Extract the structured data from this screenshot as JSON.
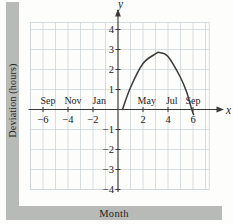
{
  "figure": {
    "y_caption": "Deviation (hours)",
    "x_caption": "Month"
  },
  "chart_data": {
    "type": "line",
    "title": "",
    "xlabel": "Month",
    "ylabel": "Deviation (hours)",
    "x_axis_letter": "x",
    "y_axis_letter": "y",
    "xlim": [
      -7,
      7.3
    ],
    "ylim": [
      -4,
      4.35
    ],
    "grid": true,
    "legend": "none",
    "x_ticks": [
      {
        "value": -6,
        "label": "−6"
      },
      {
        "value": -4,
        "label": "−4"
      },
      {
        "value": -2,
        "label": "−2"
      },
      {
        "value": 2,
        "label": "2"
      },
      {
        "value": 4,
        "label": "4"
      },
      {
        "value": 6,
        "label": "6"
      }
    ],
    "y_ticks": [
      {
        "value": 4,
        "label": "4"
      },
      {
        "value": 3,
        "label": "3"
      },
      {
        "value": 2,
        "label": "2"
      },
      {
        "value": 1,
        "label": "1"
      },
      {
        "value": -1,
        "label": "−1"
      },
      {
        "value": -2,
        "label": "−2"
      },
      {
        "value": -3,
        "label": "−3"
      },
      {
        "value": -4,
        "label": "−4"
      }
    ],
    "month_labels": [
      {
        "label": "Sep",
        "x": -5.6
      },
      {
        "label": "Nov",
        "x": -3.6
      },
      {
        "label": "Jan",
        "x": -1.5
      },
      {
        "label": "May",
        "x": 2.3
      },
      {
        "label": "Jul",
        "x": 4.3
      },
      {
        "label": "Sep",
        "x": 6.0
      }
    ],
    "series": [
      {
        "name": "deviation-curve",
        "points": [
          [
            0.36,
            0
          ],
          [
            1,
            1.1
          ],
          [
            2,
            2.3
          ],
          [
            3,
            2.78
          ],
          [
            3.3,
            2.85
          ],
          [
            4,
            2.65
          ],
          [
            5,
            1.6
          ],
          [
            5.5,
            0.85
          ],
          [
            5.9,
            0
          ],
          [
            6.05,
            -0.25
          ]
        ]
      }
    ],
    "colors": {
      "grid": "#ccd6db",
      "axis": "#3a3a3a",
      "curve": "#3a3a3a",
      "caption_bar": "#b7bab6",
      "text": "#222222"
    }
  }
}
